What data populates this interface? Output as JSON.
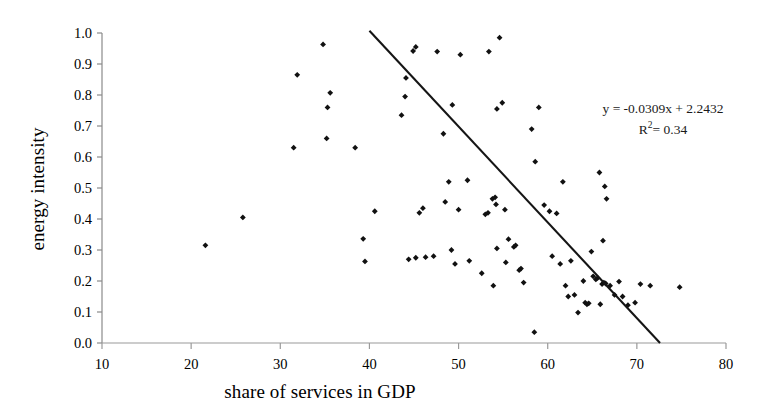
{
  "chart_data": {
    "type": "scatter",
    "title": "",
    "xlabel": "share of services in GDP",
    "ylabel": "energy intensity",
    "xlim": [
      10,
      80
    ],
    "ylim": [
      0.0,
      1.0
    ],
    "xticks": [
      "10",
      "20",
      "30",
      "40",
      "50",
      "60",
      "70",
      "80"
    ],
    "xtick_values": [
      10,
      20,
      30,
      40,
      50,
      60,
      70,
      80
    ],
    "yticks": [
      "0.0",
      "0.1",
      "0.2",
      "0.3",
      "0.4",
      "0.5",
      "0.6",
      "0.7",
      "0.8",
      "0.9",
      "1.0"
    ],
    "ytick_values": [
      0.0,
      0.1,
      0.2,
      0.3,
      0.4,
      0.5,
      0.6,
      0.7,
      0.8,
      0.9,
      1.0
    ],
    "grid": false,
    "legend": null,
    "marker_color": "#111111",
    "marker_shape": "diamond",
    "annotations": {
      "equation": "y = -0.0309x + 2.2432",
      "r_squared_prefix": "R",
      "r_squared_sup": "2",
      "r_squared_value": "= 0.34"
    },
    "trendline": {
      "type": "linear",
      "slope": -0.0309,
      "intercept": 2.2432,
      "r_squared": 0.34,
      "x_start": 40.0,
      "x_end": 72.6,
      "color": "#151515"
    },
    "series": [
      {
        "name": "countries",
        "points": [
          [
            21.6,
            0.315
          ],
          [
            25.8,
            0.405
          ],
          [
            31.5,
            0.63
          ],
          [
            31.9,
            0.865
          ],
          [
            34.8,
            0.963
          ],
          [
            35.3,
            0.76
          ],
          [
            35.6,
            0.807
          ],
          [
            35.2,
            0.66
          ],
          [
            38.4,
            0.63
          ],
          [
            39.3,
            0.336
          ],
          [
            39.5,
            0.263
          ],
          [
            40.6,
            0.425
          ],
          [
            43.6,
            0.735
          ],
          [
            44.1,
            0.855
          ],
          [
            44.9,
            0.942
          ],
          [
            45.2,
            0.955
          ],
          [
            44.0,
            0.795
          ],
          [
            45.6,
            0.42
          ],
          [
            46.0,
            0.435
          ],
          [
            44.4,
            0.27
          ],
          [
            45.2,
            0.275
          ],
          [
            46.3,
            0.277
          ],
          [
            47.2,
            0.28
          ],
          [
            48.3,
            0.675
          ],
          [
            48.9,
            0.52
          ],
          [
            48.5,
            0.455
          ],
          [
            49.2,
            0.3
          ],
          [
            49.6,
            0.255
          ],
          [
            50.0,
            0.43
          ],
          [
            51.0,
            0.525
          ],
          [
            51.2,
            0.265
          ],
          [
            47.6,
            0.94
          ],
          [
            50.2,
            0.93
          ],
          [
            49.3,
            0.768
          ],
          [
            52.6,
            0.225
          ],
          [
            53.0,
            0.415
          ],
          [
            53.3,
            0.42
          ],
          [
            53.8,
            0.465
          ],
          [
            54.1,
            0.47
          ],
          [
            54.2,
            0.447
          ],
          [
            54.3,
            0.305
          ],
          [
            53.9,
            0.185
          ],
          [
            54.6,
            0.985
          ],
          [
            55.2,
            0.43
          ],
          [
            55.3,
            0.26
          ],
          [
            55.6,
            0.335
          ],
          [
            56.2,
            0.31
          ],
          [
            56.4,
            0.315
          ],
          [
            56.8,
            0.235
          ],
          [
            54.9,
            0.775
          ],
          [
            54.3,
            0.755
          ],
          [
            53.4,
            0.94
          ],
          [
            57.0,
            0.24
          ],
          [
            57.3,
            0.195
          ],
          [
            58.5,
            0.035
          ],
          [
            58.6,
            0.585
          ],
          [
            58.2,
            0.69
          ],
          [
            59.0,
            0.76
          ],
          [
            59.6,
            0.445
          ],
          [
            60.2,
            0.425
          ],
          [
            60.5,
            0.28
          ],
          [
            61.0,
            0.418
          ],
          [
            61.4,
            0.255
          ],
          [
            61.7,
            0.52
          ],
          [
            62.0,
            0.185
          ],
          [
            62.3,
            0.15
          ],
          [
            62.6,
            0.265
          ],
          [
            63.0,
            0.155
          ],
          [
            63.4,
            0.098
          ],
          [
            64.0,
            0.2
          ],
          [
            64.2,
            0.13
          ],
          [
            64.4,
            0.125
          ],
          [
            64.6,
            0.128
          ],
          [
            64.9,
            0.295
          ],
          [
            65.1,
            0.215
          ],
          [
            65.4,
            0.205
          ],
          [
            65.6,
            0.21
          ],
          [
            65.9,
            0.125
          ],
          [
            66.1,
            0.19
          ],
          [
            66.3,
            0.195
          ],
          [
            66.5,
            0.192
          ],
          [
            66.2,
            0.33
          ],
          [
            66.6,
            0.465
          ],
          [
            65.8,
            0.55
          ],
          [
            66.4,
            0.505
          ],
          [
            67.0,
            0.185
          ],
          [
            67.5,
            0.155
          ],
          [
            68.0,
            0.198
          ],
          [
            68.4,
            0.15
          ],
          [
            69.0,
            0.122
          ],
          [
            69.8,
            0.13
          ],
          [
            70.4,
            0.19
          ],
          [
            71.5,
            0.185
          ],
          [
            74.8,
            0.18
          ]
        ]
      }
    ]
  },
  "axes": {
    "pixel_calibration": {
      "x10_px": 102,
      "x80_px": 726,
      "y0_px": 343,
      "y1_px": 33
    }
  }
}
